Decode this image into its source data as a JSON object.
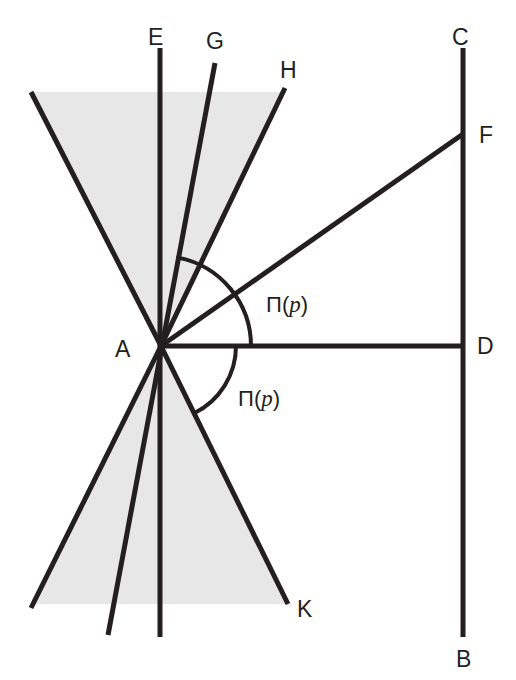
{
  "figure": {
    "type": "geometry-diagram",
    "background_color": "#ffffff",
    "stroke_color": "#231f20",
    "shade_color": "#e6e6e6",
    "vertex_label": "A",
    "labels": {
      "A": "A",
      "B": "B",
      "C": "C",
      "D": "D",
      "E": "E",
      "F": "F",
      "G": "G",
      "H": "H",
      "K": "K",
      "angle_upper_prefix": "Π(",
      "angle_upper_var": "p",
      "angle_upper_suffix": ")",
      "angle_lower_prefix": "Π(",
      "angle_lower_var": "p",
      "angle_lower_suffix": ")"
    },
    "points": {
      "A": [
        161,
        346
      ],
      "B": [
        463,
        637
      ],
      "C": [
        463,
        48
      ],
      "D": [
        463,
        346
      ],
      "E": [
        160,
        48
      ],
      "F": [
        463,
        134
      ],
      "G": [
        215,
        63
      ],
      "H": [
        285,
        88
      ],
      "K": [
        288,
        604
      ],
      "upper_left_ray_end": [
        31,
        92
      ],
      "lower_left_ray_end": [
        31,
        608
      ],
      "G_extension_end": [
        108,
        635
      ],
      "E_bottom": [
        160,
        637
      ]
    },
    "shaded_regions": [
      {
        "name": "upper-wedge",
        "top_y": 92,
        "points": "161,346 31,92 285,92 285,88"
      },
      {
        "name": "lower-wedge",
        "bottom_y": 604,
        "points": "161,346 31,604 288,604"
      }
    ],
    "arcs": [
      {
        "name": "upper-angle-arc",
        "radius": 90,
        "from": "ray-AG",
        "to": "ray-AD"
      },
      {
        "name": "lower-angle-arc",
        "radius": 75,
        "from": "ray-AD",
        "to": "ray-AK"
      }
    ]
  }
}
